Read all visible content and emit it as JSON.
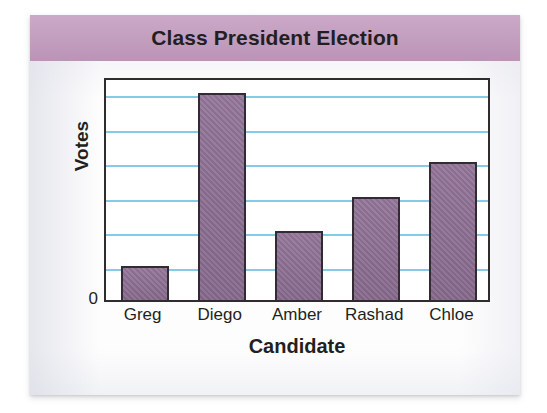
{
  "card": {
    "title": "Class President Election",
    "title_band_color": "#c49cc0"
  },
  "chart_data": {
    "type": "bar",
    "title": "Class President Election",
    "xlabel": "Candidate",
    "ylabel": "Votes",
    "categories": [
      "Greg",
      "Diego",
      "Amber",
      "Rashad",
      "Chloe"
    ],
    "values": [
      1,
      6,
      2,
      3,
      4
    ],
    "ylim": [
      0,
      6.5
    ],
    "y_tick_labels": [
      "0"
    ],
    "gridlines": {
      "visible": true,
      "orientation": "horizontal",
      "count": 6,
      "values": [
        1,
        2,
        3,
        4,
        5,
        6
      ],
      "color": "#84cbe8"
    },
    "bar_color": "#8e6f94",
    "bar_edge_color": "#322b33",
    "legend": null,
    "plot_background": "#ffffff",
    "axis_color": "#2f2c2e"
  }
}
